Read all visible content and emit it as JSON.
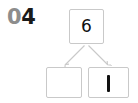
{
  "worksheet": {
    "question_number": {
      "prefix": "0",
      "value": "4",
      "full": "04",
      "prefix_color": "#8d8d8d",
      "value_color": "#1a1a1a"
    },
    "diagram": {
      "type": "number-bond",
      "title": "",
      "total_node": {
        "label": "6",
        "filled": true,
        "box_color": "#c9c9c9"
      },
      "part_nodes": [
        {
          "label": "",
          "filled": false,
          "position": "left",
          "box_color": "#c9c9c9"
        },
        {
          "label": "1",
          "filled": true,
          "position": "right",
          "box_color": "#c9c9c9",
          "glyph_style": "vertical-stroke"
        }
      ],
      "arrows": [
        {
          "from": "total",
          "to": "left-part",
          "color": "#c9c9c9"
        },
        {
          "from": "total",
          "to": "right-part",
          "color": "#c9c9c9"
        }
      ]
    }
  }
}
